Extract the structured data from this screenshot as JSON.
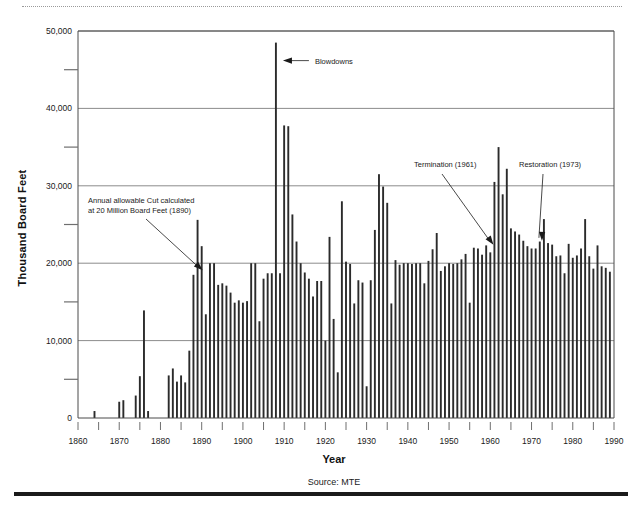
{
  "figure": {
    "source_note": "Source: MTE",
    "has_top_dotted_rule": true,
    "has_bottom_black_rule": true
  },
  "chart_data": {
    "type": "bar",
    "title": "",
    "xlabel": "Year",
    "ylabel": "Thousand Board Feet",
    "xlim": [
      1860,
      1990
    ],
    "ylim": [
      0,
      50000
    ],
    "ytick_major_step": 10000,
    "ytick_minor_step": 5000,
    "xtick_major_step": 10,
    "xtick_minor_step": 5,
    "grid": "horizontal-major",
    "legend": "none",
    "y_tick_labels": [
      "0",
      "10,000",
      "20,000",
      "30,000",
      "40,000",
      "50,000"
    ],
    "y_tick_values": [
      0,
      10000,
      20000,
      30000,
      40000,
      50000
    ],
    "x_tick_labels": [
      "1860",
      "1870",
      "1880",
      "1890",
      "1900",
      "1910",
      "1920",
      "1930",
      "1940",
      "1950",
      "1960",
      "1970",
      "1980",
      "1990"
    ],
    "x_tick_values": [
      1860,
      1870,
      1880,
      1890,
      1900,
      1910,
      1920,
      1930,
      1940,
      1950,
      1960,
      1970,
      1980,
      1990
    ],
    "x": [
      1864,
      1865,
      1870,
      1871,
      1872,
      1874,
      1875,
      1876,
      1877,
      1878,
      1882,
      1883,
      1884,
      1885,
      1886,
      1887,
      1888,
      1889,
      1890,
      1891,
      1892,
      1893,
      1894,
      1895,
      1896,
      1897,
      1898,
      1899,
      1900,
      1901,
      1902,
      1903,
      1904,
      1905,
      1906,
      1907,
      1908,
      1909,
      1910,
      1911,
      1912,
      1913,
      1914,
      1915,
      1916,
      1917,
      1918,
      1919,
      1920,
      1921,
      1922,
      1923,
      1924,
      1925,
      1926,
      1927,
      1928,
      1929,
      1930,
      1931,
      1932,
      1933,
      1934,
      1935,
      1936,
      1937,
      1938,
      1939,
      1940,
      1941,
      1942,
      1943,
      1944,
      1945,
      1946,
      1947,
      1948,
      1949,
      1950,
      1951,
      1952,
      1953,
      1954,
      1955,
      1956,
      1957,
      1958,
      1959,
      1960,
      1961,
      1962,
      1963,
      1964,
      1965,
      1966,
      1967,
      1968,
      1969,
      1970,
      1971,
      1972,
      1973,
      1974,
      1975,
      1976,
      1977,
      1978,
      1979,
      1980,
      1981,
      1982,
      1983,
      1984,
      1985,
      1986,
      1987,
      1988,
      1989,
      1990
    ],
    "values": [
      900,
      0,
      2100,
      2300,
      0,
      2900,
      5400,
      13900,
      900,
      0,
      5500,
      6400,
      4700,
      5500,
      4600,
      8700,
      18500,
      25600,
      22200,
      13400,
      20000,
      20000,
      17200,
      17400,
      17100,
      16200,
      14900,
      15200,
      14900,
      15100,
      20000,
      20000,
      12500,
      18000,
      18700,
      18700,
      48500,
      18700,
      37800,
      37700,
      26300,
      22800,
      20000,
      18800,
      18000,
      15700,
      17700,
      17700,
      10000,
      23400,
      12800,
      5900,
      28000,
      20200,
      19900,
      14800,
      17800,
      17500,
      4100,
      17800,
      24300,
      31500,
      29900,
      27800,
      14800,
      20400,
      19800,
      20000,
      20000,
      19900,
      20000,
      20000,
      17400,
      20300,
      21800,
      23900,
      19000,
      19600,
      20000,
      19900,
      20000,
      20500,
      21200,
      14900,
      22000,
      21900,
      21100,
      22300,
      21400,
      30500,
      35000,
      28900,
      32200,
      24500,
      24100,
      23700,
      22900,
      22200,
      21900,
      21900,
      22800,
      25700,
      22600,
      22400,
      20900,
      21000,
      18700,
      22500,
      20700,
      21000,
      21900,
      25700,
      20900,
      19300,
      22300,
      19600,
      19400,
      18900,
      0
    ]
  },
  "annotations": [
    {
      "id": "blowdowns",
      "label": "Blowdowns",
      "target_year": 1908,
      "target_value": 48500
    },
    {
      "id": "allowable-cut",
      "label_line1": "Annual allowable Cut calculated",
      "label_line2": "at 20 Million Board Feet (1890)",
      "target_year": 1890,
      "target_value": 20000
    },
    {
      "id": "termination",
      "label": "Termination (1961)",
      "target_year": 1961,
      "target_value": 22000
    },
    {
      "id": "restoration",
      "label": "Restoration (1973)",
      "target_year": 1973,
      "target_value": 22500
    }
  ],
  "colors": {
    "bar": "#2b2b2b",
    "grid": "#6f6f6f",
    "axis": "#4a4a4a",
    "text": "#1a1a1a",
    "background": "#ffffff"
  }
}
